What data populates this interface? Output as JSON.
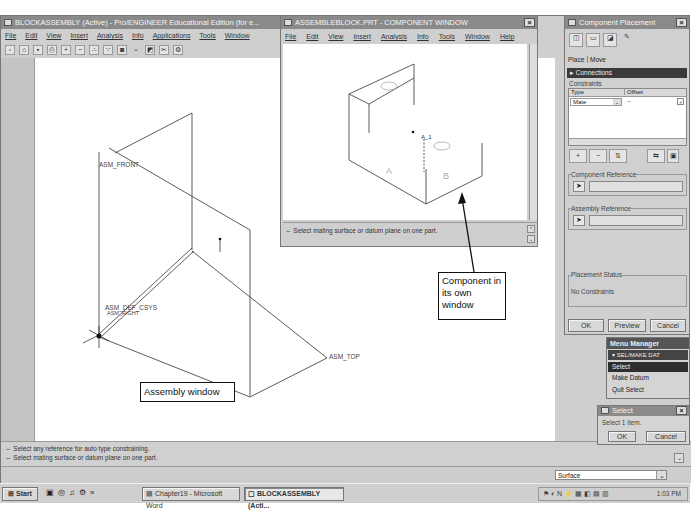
{
  "assembly_window": {
    "title": "BLOCKASSEMBLY (Active) - Pro/ENGINEER Educational Edition (for e...",
    "menu": [
      "File",
      "Edit",
      "View",
      "Insert",
      "Analysis",
      "Info",
      "Applications",
      "Tools",
      "Window"
    ],
    "toolbar_icons": [
      "new-icon",
      "open-icon",
      "save-icon",
      "print-icon",
      "zoom-in-icon",
      "zoom-out-icon",
      "repaint-icon",
      "datum-icon",
      "find-icon",
      "dropdown-icon",
      "sketch-icon",
      "cut-icon",
      "model-tree-icon"
    ],
    "datum_labels": {
      "front": "ASM_FRONT",
      "right": "ASM_RIGHT",
      "csys": "ASM_DEF_CSYS",
      "top": "ASM_TOP"
    },
    "messages": [
      "Select any reference for auto type constraining.",
      "Select mating surface or datum plane on one part."
    ],
    "filter_value": "Surface"
  },
  "component_window": {
    "title": "ASSEMBLEBLOCK.PRT - COMPONENT WINDOW",
    "menu": [
      "File",
      "Edit",
      "View",
      "Insert",
      "Analysis",
      "Info",
      "Tools",
      "Window",
      "Help"
    ],
    "part_labels": {
      "axis": "A_1",
      "face_a": "A",
      "face_b": "B"
    },
    "message": "Select mating surface or datum plane on one part."
  },
  "component_placement": {
    "title": "Component Placement",
    "tabs": [
      "Place",
      "Move"
    ],
    "connections_label": "Connections",
    "constraints_label": "Constraints",
    "columns": [
      "Type",
      "Offset"
    ],
    "rows": [
      {
        "type": "Mate",
        "offset": "--"
      }
    ],
    "component_reference_label": "Component Reference",
    "assembly_reference_label": "Assembly Reference",
    "placement_status_label": "Placement Status",
    "placement_status": "No Constraints",
    "buttons": {
      "ok": "OK",
      "preview": "Preview",
      "cancel": "Cancel"
    }
  },
  "menu_manager": {
    "title": "Menu Manager",
    "header": "SEL/MAKE DAT",
    "items": [
      "Select",
      "Make Datum",
      "Quit Select"
    ]
  },
  "select_dialog": {
    "title": "Select",
    "message": "Select 1 item.",
    "ok": "OK",
    "cancel": "Cancel"
  },
  "callouts": {
    "component": "Component in its own window",
    "assembly": "Assembly window"
  },
  "taskbar": {
    "start": "Start",
    "tasks": [
      "Chapter19 - Microsoft Word",
      "BLOCKASSEMBLY (Acti..."
    ],
    "clock": "1:03 PM"
  }
}
